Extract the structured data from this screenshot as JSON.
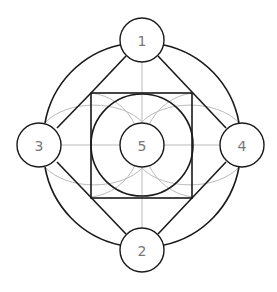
{
  "diagram": {
    "nodes": [
      {
        "id": "1",
        "label": "1",
        "cx": 142,
        "cy": 40
      },
      {
        "id": "2",
        "label": "2",
        "cx": 142,
        "cy": 250
      },
      {
        "id": "3",
        "label": "3",
        "cx": 39,
        "cy": 145
      },
      {
        "id": "4",
        "label": "4",
        "cx": 242,
        "cy": 145
      },
      {
        "id": "5",
        "label": "5",
        "cx": 142,
        "cy": 145
      }
    ],
    "colors": {
      "stroke_dark": "#1a1a1a",
      "stroke_light": "#aaaaaa",
      "label": "#777777",
      "background": "#ffffff"
    }
  }
}
